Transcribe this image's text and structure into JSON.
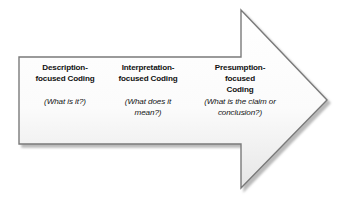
{
  "diagram": {
    "type": "block-arrow-process",
    "direction": "right",
    "background_color": "#ffffff",
    "arrow": {
      "fill_start_color": "#ffffff",
      "fill_end_color": "#e8e8e8",
      "stroke_color": "#7a7a7a",
      "shadow_color": "#8c8c8c",
      "points": "19,57 241,57 241,10 327,100 241,188 241,144 19,144"
    },
    "stages": [
      {
        "id": "description",
        "heading": "Description-\nfocused Coding",
        "question": "(What is it?)"
      },
      {
        "id": "interpretation",
        "heading": "Interpretation-\nfocused Coding",
        "question": "(What does it\nmean?)"
      },
      {
        "id": "presumption",
        "heading": "Presumption-\nfocused\nCoding",
        "question": "(What is the claim or\nconclusion?)"
      }
    ]
  }
}
